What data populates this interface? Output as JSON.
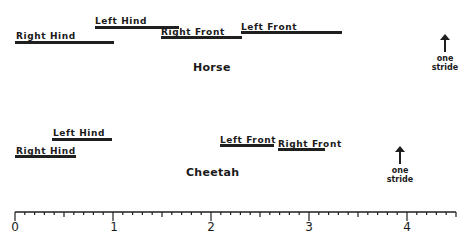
{
  "diagram": {
    "type": "gait-timing-diagram",
    "axis": {
      "min": 0,
      "max": 4.5,
      "major_ticks": [
        0,
        1,
        2,
        3,
        4
      ],
      "minor_step": 0.1,
      "tick_labels": [
        "0",
        "1",
        "2",
        "3",
        "4"
      ]
    },
    "horse": {
      "title": "Horse",
      "stride_label_line1": "one",
      "stride_label_line2": "stride",
      "stride_marker_at": 4.4,
      "bars": [
        {
          "label": "Right Hind",
          "start": 0.0,
          "end": 1.0
        },
        {
          "label": "Left Hind",
          "start": 0.8,
          "end": 1.67
        },
        {
          "label": "Right Front",
          "start": 1.5,
          "end": 2.3
        },
        {
          "label": "Left Front",
          "start": 2.3,
          "end": 3.33
        }
      ]
    },
    "cheetah": {
      "title": "Cheetah",
      "stride_label_line1": "one",
      "stride_label_line2": "stride",
      "stride_marker_at": 3.9,
      "bars": [
        {
          "label": "Left Hind",
          "start": 0.38,
          "end": 1.0
        },
        {
          "label": "Right Hind",
          "start": 0.0,
          "end": 0.62
        },
        {
          "label": "Left Front",
          "start": 2.1,
          "end": 2.65
        },
        {
          "label": "Right Front",
          "start": 2.7,
          "end": 3.2
        }
      ]
    }
  }
}
